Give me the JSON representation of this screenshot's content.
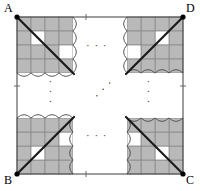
{
  "figure": {
    "type": "geometric-diagram",
    "canvas": {
      "width": 200,
      "height": 191
    },
    "square": {
      "left": 17,
      "top": 17,
      "right": 183,
      "bottom": 174,
      "stroke": "#3c3c3c",
      "stroke_width": 1
    },
    "vertices": [
      {
        "id": "A",
        "label": "A",
        "position": "top-left",
        "x": 17,
        "y": 17,
        "label_x": 4,
        "label_y": 2
      },
      {
        "id": "D",
        "label": "D",
        "position": "top-right",
        "x": 183,
        "y": 17,
        "label_x": 186,
        "label_y": 2
      },
      {
        "id": "B",
        "label": "B",
        "position": "bottom-left",
        "x": 17,
        "y": 174,
        "label_x": 4,
        "label_y": 174
      },
      {
        "id": "C",
        "label": "C",
        "position": "bottom-right",
        "x": 183,
        "y": 174,
        "label_x": 186,
        "label_y": 174
      }
    ],
    "vertex_dot": {
      "radius": 2.6,
      "fill": "#000000"
    },
    "diagonals": [
      {
        "id": "diagonal-A",
        "from": "A",
        "x1": 17,
        "y1": 17,
        "x2": 74,
        "y2": 74,
        "stroke": "#1a1a1a",
        "stroke_width": 2.2
      },
      {
        "id": "diagonal-D",
        "from": "D",
        "x1": 183,
        "y1": 17,
        "x2": 126,
        "y2": 74,
        "stroke": "#1a1a1a",
        "stroke_width": 2.2
      },
      {
        "id": "diagonal-B",
        "from": "B",
        "x1": 17,
        "y1": 174,
        "x2": 74,
        "y2": 117,
        "stroke": "#1a1a1a",
        "stroke_width": 2.2
      },
      {
        "id": "diagonal-C",
        "from": "C",
        "x1": 183,
        "y1": 174,
        "x2": 126,
        "y2": 117,
        "stroke": "#1a1a1a",
        "stroke_width": 2.2
      }
    ],
    "grid": {
      "cell_size": 14,
      "columns": 4,
      "rows": 4,
      "line_color": "#8a8a8a",
      "line_width": 0.8,
      "shaded_fill": "#b9b9b9",
      "empty_fill": "#ffffff",
      "note": "each corner block is a 4x4 arrangement of cells, shaded in a broken checkerboard"
    },
    "blocks": [
      {
        "id": "block-top-left",
        "corner": "A",
        "origin_x": 17,
        "origin_y": 17,
        "dir_x": 1,
        "dir_y": 1,
        "shaded_cells": [
          [
            0,
            0
          ],
          [
            1,
            0
          ],
          [
            2,
            0
          ],
          [
            3,
            0
          ],
          [
            0,
            1
          ],
          [
            2,
            1
          ],
          [
            3,
            1
          ],
          [
            0,
            2
          ],
          [
            1,
            2
          ],
          [
            2,
            2
          ],
          [
            0,
            3
          ],
          [
            1,
            3
          ],
          [
            2,
            3
          ],
          [
            3,
            3
          ]
        ]
      },
      {
        "id": "block-top-right",
        "corner": "D",
        "origin_x": 183,
        "origin_y": 17,
        "dir_x": -1,
        "dir_y": 1,
        "shaded_cells": [
          [
            0,
            0
          ],
          [
            1,
            0
          ],
          [
            2,
            0
          ],
          [
            3,
            0
          ],
          [
            0,
            1
          ],
          [
            2,
            1
          ],
          [
            3,
            1
          ],
          [
            0,
            2
          ],
          [
            1,
            2
          ],
          [
            2,
            2
          ],
          [
            0,
            3
          ],
          [
            1,
            3
          ],
          [
            2,
            3
          ],
          [
            3,
            3
          ]
        ]
      },
      {
        "id": "block-bottom-left",
        "corner": "B",
        "origin_x": 17,
        "origin_y": 174,
        "dir_x": 1,
        "dir_y": -1,
        "shaded_cells": [
          [
            0,
            0
          ],
          [
            1,
            0
          ],
          [
            2,
            0
          ],
          [
            3,
            0
          ],
          [
            0,
            1
          ],
          [
            2,
            1
          ],
          [
            3,
            1
          ],
          [
            0,
            2
          ],
          [
            1,
            2
          ],
          [
            2,
            2
          ],
          [
            0,
            3
          ],
          [
            1,
            3
          ],
          [
            2,
            3
          ],
          [
            3,
            3
          ]
        ]
      },
      {
        "id": "block-bottom-right",
        "corner": "C",
        "origin_x": 183,
        "origin_y": 174,
        "dir_x": -1,
        "dir_y": -1,
        "shaded_cells": [
          [
            0,
            0
          ],
          [
            1,
            0
          ],
          [
            2,
            0
          ],
          [
            3,
            0
          ],
          [
            0,
            1
          ],
          [
            2,
            1
          ],
          [
            3,
            1
          ],
          [
            0,
            2
          ],
          [
            1,
            2
          ],
          [
            2,
            2
          ],
          [
            0,
            3
          ],
          [
            1,
            3
          ],
          [
            2,
            3
          ],
          [
            3,
            3
          ]
        ]
      }
    ],
    "torn_edges": {
      "stroke": "#4a4a4a",
      "stroke_width": 0.9,
      "fill": "#ffffff",
      "amplitude": 4,
      "wavelength": 14,
      "note": "wavy break lines truncating each grid block on its inner sides"
    },
    "ellipses": [
      {
        "id": "ellipsis-top",
        "glyph": "· · ·",
        "orientation": "horizontal",
        "x": 86,
        "y": 40
      },
      {
        "id": "ellipsis-bottom",
        "glyph": "· · ·",
        "orientation": "horizontal",
        "x": 86,
        "y": 130
      },
      {
        "id": "ellipsis-left",
        "glyph": "· · ·",
        "orientation": "vertical",
        "x": 45,
        "y": 80
      },
      {
        "id": "ellipsis-right",
        "glyph": "· · ·",
        "orientation": "vertical",
        "x": 143,
        "y": 80
      },
      {
        "id": "ellipsis-center-diag",
        "glyph": "· · ·",
        "orientation": "diagonal",
        "x": 92,
        "y": 83
      }
    ],
    "edge_ticks": [
      {
        "id": "tick-top",
        "x": 86,
        "y": 17
      },
      {
        "id": "tick-bottom",
        "x": 86,
        "y": 174
      },
      {
        "id": "tick-left",
        "x": 17,
        "y": 86
      },
      {
        "id": "tick-right",
        "x": 183,
        "y": 86
      }
    ]
  }
}
